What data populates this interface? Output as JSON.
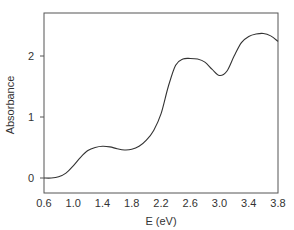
{
  "chart_data": {
    "type": "line",
    "title": "",
    "xlabel": "E (eV)",
    "ylabel": "Absorbance",
    "xlim": [
      0.6,
      3.8
    ],
    "ylim": [
      -0.25,
      2.7
    ],
    "xticks": [
      0.6,
      1.0,
      1.4,
      1.8,
      2.2,
      2.6,
      3.0,
      3.4,
      3.8
    ],
    "xtick_labels": [
      "0.6",
      "1.0",
      "1.4",
      "1.8",
      "2.2",
      "2.6",
      "3.0",
      "3.4",
      "3.8"
    ],
    "yticks": [
      0,
      1,
      2
    ],
    "ytick_labels": [
      "0",
      "1",
      "2"
    ],
    "grid": false,
    "legend": null,
    "series": [
      {
        "name": "Absorbance",
        "color": "#333333",
        "x": [
          0.6,
          0.7,
          0.8,
          0.9,
          1.0,
          1.1,
          1.2,
          1.3,
          1.4,
          1.5,
          1.6,
          1.7,
          1.8,
          1.9,
          2.0,
          2.1,
          2.2,
          2.3,
          2.4,
          2.5,
          2.6,
          2.7,
          2.8,
          2.9,
          3.0,
          3.1,
          3.2,
          3.3,
          3.4,
          3.5,
          3.6,
          3.7,
          3.8
        ],
        "y": [
          0.0,
          0.0,
          0.02,
          0.08,
          0.2,
          0.34,
          0.45,
          0.5,
          0.52,
          0.51,
          0.48,
          0.46,
          0.47,
          0.52,
          0.62,
          0.78,
          1.05,
          1.5,
          1.85,
          1.95,
          1.96,
          1.95,
          1.9,
          1.78,
          1.68,
          1.75,
          2.0,
          2.22,
          2.32,
          2.36,
          2.37,
          2.33,
          2.24
        ]
      }
    ]
  }
}
